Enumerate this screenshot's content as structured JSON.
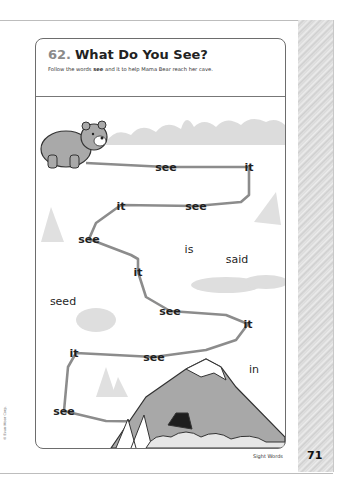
{
  "page": {
    "activity_number": "62.",
    "title": "What Do You See?",
    "instructions": {
      "prefix": "Follow the words ",
      "bold_word": "see",
      "suffix": " and it to help Mama Bear reach her cave."
    },
    "footer_label": "Sight Words",
    "page_number": "71",
    "copyright": "© Evan-Moor Corp."
  },
  "maze": {
    "start": "bear",
    "goal": "cave",
    "path_color": "#8c8c8c",
    "path_words": [
      {
        "text": "see",
        "x": 130,
        "y": 70
      },
      {
        "text": "it",
        "x": 213,
        "y": 70
      },
      {
        "text": "see",
        "x": 160,
        "y": 109
      },
      {
        "text": "it",
        "x": 85,
        "y": 109
      },
      {
        "text": "see",
        "x": 53,
        "y": 142
      },
      {
        "text": "it",
        "x": 102,
        "y": 175
      },
      {
        "text": "see",
        "x": 134,
        "y": 214
      },
      {
        "text": "it",
        "x": 212,
        "y": 227
      },
      {
        "text": "see",
        "x": 118,
        "y": 260
      },
      {
        "text": "it",
        "x": 38,
        "y": 256
      },
      {
        "text": "see",
        "x": 28,
        "y": 314
      }
    ],
    "distractor_words": [
      {
        "text": "is",
        "x": 153,
        "y": 152
      },
      {
        "text": "said",
        "x": 201,
        "y": 162
      },
      {
        "text": "seed",
        "x": 27,
        "y": 204
      },
      {
        "text": "in",
        "x": 218,
        "y": 272
      }
    ]
  }
}
